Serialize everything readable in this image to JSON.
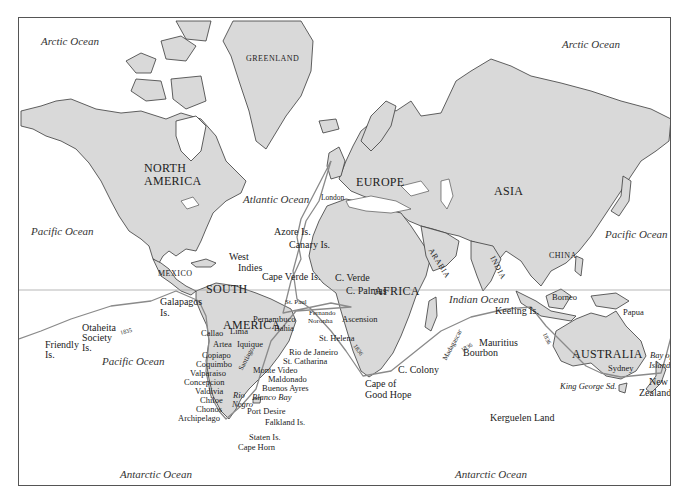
{
  "map": {
    "title": "Voyage of the Beagle world route map",
    "colors": {
      "land": "#d9d9d9",
      "coast": "#3a3a3a",
      "route": "#8a8a8a",
      "sea": "#ffffff",
      "frame": "#555555"
    },
    "oceans": {
      "arctic_left": "Arctic Ocean",
      "arctic_right": "Arctic Ocean",
      "pacific_nw": "Pacific Ocean",
      "pacific_ne": "Pacific Ocean",
      "pacific_s": "Pacific Ocean",
      "atlantic": "Atlantic Ocean",
      "indian": "Indian Ocean",
      "antarctic_left": "Antarctic Ocean",
      "antarctic_right": "Antarctic Ocean"
    },
    "continents": {
      "greenland": "GREENLAND",
      "north_america_1": "NORTH",
      "north_america_2": "AMERICA",
      "europe": "EUROPE",
      "asia": "ASIA",
      "africa": "AFRICA",
      "south_america_1": "SOUTH",
      "south_america_2": "AMERICA",
      "australia": "AUSTRALIA"
    },
    "regions": {
      "mexico": "MEXICO",
      "arabia": "ARABIA",
      "india": "INDIA",
      "china": "CHINA",
      "santiago": "Santiago",
      "madagascar": "Madagascar"
    },
    "places": {
      "london": "London",
      "azore": "Azore Is.",
      "canary": "Canary Is.",
      "west": "West",
      "indies": "Indies",
      "cape_verde_is": "Cape Verde Is.",
      "c_verde": "C. Verde",
      "c_palmas": "C. Palmas",
      "st_paul": "St. Paul",
      "fernando": "Fernando",
      "noronha": "Noronha",
      "ascension": "Ascension",
      "st_helena": "St. Helena",
      "pernambuco": "Pernambuco",
      "bahia": "Bahia",
      "galapagos": "Galapagos",
      "galapagos_is": "Is.",
      "otaheita": "Otaheita",
      "society": "Society",
      "society_is": "Is.",
      "friendly": "Friendly",
      "friendly_is": "Is.",
      "callao": "Callao",
      "lima": "Lima",
      "artea": "Artea",
      "iquique": "Iquique",
      "copiapo": "Copiapo",
      "coquimbo": "Coquimbo",
      "valparaiso": "Valparaiso",
      "concepcion": "Concepcion",
      "valdivia": "Valdivia",
      "chiloe": "Chiloe",
      "chonos": "Chonos",
      "archipelago": "Archipelago",
      "rio_de_janeiro": "Rio de Janeiro",
      "st_catharina": "St. Catharina",
      "monte_video": "Monte Video",
      "maldonado": "Maldonado",
      "buenos_ayres": "Buenos Ayres",
      "rio": "Rio",
      "negro": "Negro",
      "blanco_bay": "Blanco Bay",
      "port_desire": "Port Desire",
      "falkland": "Falkland Is.",
      "staten": "Staten Is.",
      "cape_horn": "Cape Horn",
      "cape_of": "Cape of",
      "good_hope": "Good Hope",
      "c_colony": "C. Colony",
      "mauritius": "Mauritius",
      "bourbon": "Bourbon",
      "keeling": "Keeling Is.",
      "kerguelen": "Kerguelen Land",
      "borneo": "Borneo",
      "papua": "Papua",
      "sydney": "Sydney",
      "king_george": "King George Sd.",
      "bay_of": "Bay of",
      "islands": "Islands",
      "new": "New",
      "zealand": "Zealand"
    },
    "route_labels": {
      "r1": "1835",
      "r2": "1836",
      "r3": "1836",
      "r4": "1836"
    }
  }
}
